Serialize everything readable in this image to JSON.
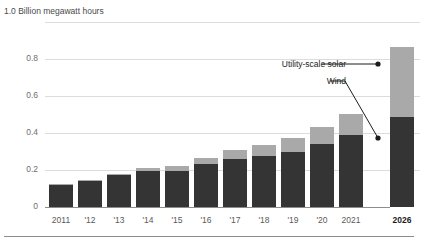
{
  "chart_data": {
    "type": "bar",
    "stacked": true,
    "title": "",
    "subtitle": "",
    "xlabel": "",
    "ylabel": "1.0 Billion megawatt hours",
    "axis_caption": "1.0 Billion megawatt hours",
    "ylim": [
      0,
      1.0
    ],
    "ytick_labels": [
      "1.0",
      "0.8",
      "0.6",
      "0.4",
      "0.2",
      "0"
    ],
    "ytick_values": [
      1.0,
      0.8,
      0.6,
      0.4,
      0.2,
      0
    ],
    "grid": true,
    "legend_position": "callout-annotations",
    "categories": [
      "2011",
      "'12",
      "'13",
      "'14",
      "'15",
      "'16",
      "'17",
      "'18",
      "'19",
      "'20",
      "2021",
      "2026"
    ],
    "forecast_category": "2026",
    "series": [
      {
        "name": "Wind",
        "color": "#343434",
        "values": [
          0.12,
          0.143,
          0.172,
          0.192,
          0.195,
          0.232,
          0.258,
          0.277,
          0.3,
          0.34,
          0.39,
          0.487
        ]
      },
      {
        "name": "Utility-scale solar",
        "color": "#a9a9a9",
        "values": [
          0.002,
          0.004,
          0.009,
          0.018,
          0.025,
          0.033,
          0.048,
          0.06,
          0.073,
          0.09,
          0.115,
          0.378
        ]
      }
    ],
    "totals": [
      0.122,
      0.147,
      0.181,
      0.21,
      0.22,
      0.265,
      0.306,
      0.337,
      0.373,
      0.43,
      0.505,
      0.865
    ],
    "annotations": [
      {
        "name": "Utility-scale solar",
        "label": "Utility-scale solar",
        "target_series": "Utility-scale solar"
      },
      {
        "name": "Wind",
        "label": "Wind",
        "target_series": "Wind"
      }
    ]
  },
  "callouts": {
    "solar": "Utility-scale solar",
    "wind": "Wind"
  },
  "axis": {
    "caption": "1.0 Billion megawatt hours",
    "ticks": [
      "0.8",
      "0.6",
      "0.4",
      "0.2",
      "0"
    ]
  },
  "xlabels": [
    "2011",
    "'12",
    "'13",
    "'14",
    "'15",
    "'16",
    "'17",
    "'18",
    "'19",
    "'20",
    "2021",
    "2026"
  ]
}
